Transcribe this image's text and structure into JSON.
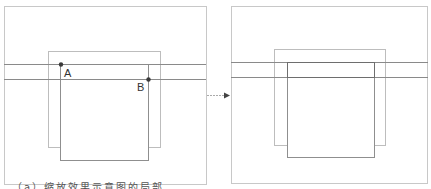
{
  "diagram": {
    "type": "geometric transformation illustration",
    "colors": {
      "frame": "#c8c8c8",
      "light_square": "#bdbdbd",
      "dark_square": "#8f8f8f",
      "lines": "#8a8a8a",
      "points": "#3a3a3a",
      "arrow": "#444444"
    },
    "left_panel": {
      "frame": {
        "x": 4,
        "y": 6,
        "w": 202,
        "h": 178
      },
      "light_square": {
        "x": 48,
        "y": 51,
        "w": 112,
        "h": 96
      },
      "dark_square": {
        "x": 60,
        "y": 64,
        "w": 88,
        "h": 96
      },
      "lines_y": [
        64,
        79
      ],
      "points": [
        {
          "name": "A",
          "x": 61,
          "y": 64,
          "label": "A",
          "label_x": 64,
          "label_y": 77
        },
        {
          "name": "B",
          "x": 148,
          "y": 79,
          "label": "B",
          "label_x": 137,
          "label_y": 91
        }
      ]
    },
    "arrow": {
      "x1": 207,
      "y1": 95,
      "x2": 230,
      "y2": 95,
      "style": "dashed"
    },
    "right_panel": {
      "frame": {
        "x": 231,
        "y": 6,
        "w": 197,
        "h": 177
      },
      "light_square": {
        "x": 274,
        "y": 49,
        "w": 111,
        "h": 96
      },
      "dark_square": {
        "x": 287,
        "y": 62,
        "w": 87,
        "h": 95
      },
      "lines_y": [
        62,
        77
      ]
    },
    "caption": "（a）缩放效果示意图的局部"
  }
}
